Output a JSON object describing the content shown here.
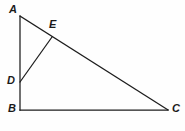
{
  "figure": {
    "type": "geometry-diagram",
    "background_color": "#fefefe",
    "line_color": "#1c1c1c",
    "label_color": "#1a1a1a",
    "points": [
      {
        "id": "A",
        "label": "A",
        "x": 20,
        "y": 16,
        "label_x": 9,
        "label_y": 4
      },
      {
        "id": "E",
        "label": "E",
        "x": 52,
        "y": 37,
        "label_x": 49,
        "label_y": 19
      },
      {
        "id": "D",
        "label": "D",
        "x": 20,
        "y": 82,
        "label_x": 7,
        "label_y": 75
      },
      {
        "id": "B",
        "label": "B",
        "x": 20,
        "y": 110,
        "label_x": 8,
        "label_y": 103
      },
      {
        "id": "C",
        "label": "C",
        "x": 168,
        "y": 110,
        "label_x": 172,
        "label_y": 103
      }
    ],
    "segments": [
      {
        "id": "AB",
        "name": "segment-ab",
        "x1": 20,
        "y1": 16,
        "x2": 20,
        "y2": 110
      },
      {
        "id": "BC",
        "name": "segment-bc",
        "x1": 20,
        "y1": 110,
        "x2": 168,
        "y2": 110
      },
      {
        "id": "AC",
        "name": "segment-ac",
        "x1": 20,
        "y1": 16,
        "x2": 168,
        "y2": 110
      },
      {
        "id": "DE",
        "name": "segment-de",
        "x1": 20,
        "y1": 82,
        "x2": 52,
        "y2": 37
      }
    ]
  }
}
